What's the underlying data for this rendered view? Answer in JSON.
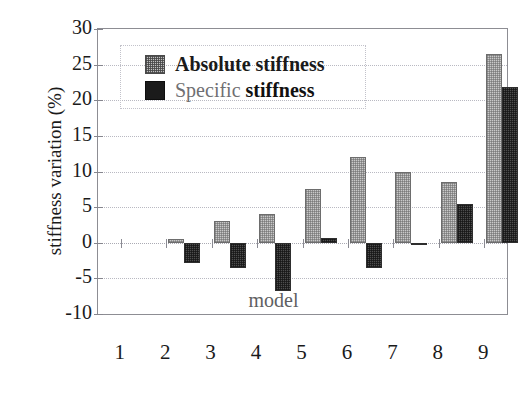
{
  "chart_data": {
    "type": "bar",
    "title": "",
    "xlabel": "model",
    "ylabel": "stiffness variation (%)",
    "categories": [
      "1",
      "2",
      "3",
      "4",
      "5",
      "6",
      "7",
      "8",
      "9"
    ],
    "series": [
      {
        "name": "Absolute stiffness",
        "key": "absolute",
        "color": "#c9c9c9",
        "values": [
          0,
          0.5,
          3.0,
          4.0,
          7.5,
          12.0,
          10.0,
          8.5,
          26.5
        ]
      },
      {
        "name": "Specific stiffness",
        "key": "specific",
        "color": "#3a3a3a",
        "values": [
          0,
          -2.8,
          -3.6,
          -6.8,
          0.7,
          -3.5,
          0.0,
          5.5,
          21.8
        ]
      }
    ],
    "ylim": [
      -10,
      30
    ],
    "ytick_step": 5,
    "yticks": [
      30,
      25,
      20,
      15,
      10,
      5,
      0,
      -5,
      -10
    ],
    "ytick_labels": [
      "30",
      "25",
      "20",
      "15",
      "10",
      "5",
      "0",
      "-5",
      "-10"
    ],
    "grid": true,
    "legend_position": "top-left",
    "legend_entries": [
      {
        "label": "Absolute stiffness",
        "swatch": "checkered-gray-swatch"
      },
      {
        "label": "Specific stiffness",
        "swatch": "solid-black-swatch"
      }
    ]
  },
  "axes": {
    "y_title": "stiffness variation (%)",
    "x_title": "model"
  }
}
